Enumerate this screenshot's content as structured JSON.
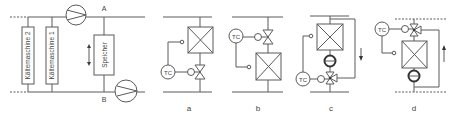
{
  "system": {
    "node_a_label": "A",
    "node_b_label": "B",
    "chiller_2_label": "Kältemaschine 2",
    "chiller_1_label": "Kältemaschine 1",
    "storage_label": "Speicher"
  },
  "variants": [
    {
      "label": "a",
      "controller_label": "TC"
    },
    {
      "label": "b",
      "controller_label": "TC"
    },
    {
      "label": "c",
      "controller_label": "TC"
    },
    {
      "label": "d",
      "controller_label": "TC"
    }
  ],
  "colors": {
    "line": "#5a5a5a",
    "background": "#ffffff"
  }
}
